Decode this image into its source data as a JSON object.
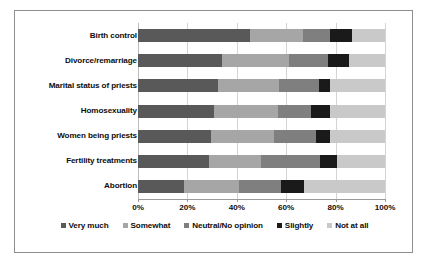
{
  "chart_data": {
    "type": "bar",
    "orientation": "horizontal",
    "stacked": true,
    "stacked_mode": "percent",
    "title": "",
    "subtitle": "",
    "xlabel": "",
    "ylabel": "",
    "xlim": [
      0,
      100
    ],
    "xticks": [
      0,
      20,
      40,
      60,
      80,
      100
    ],
    "xtick_labels": [
      "0%",
      "20%",
      "40%",
      "60%",
      "80%",
      "100%"
    ],
    "grid": true,
    "grid_axis": "x",
    "legend_position": "bottom",
    "categories": [
      "Birth control",
      "Divorce/remarriage",
      "Marital status of priests",
      "Homosexuality",
      "Women being priests",
      "Fertility treatments",
      "Abortion"
    ],
    "series": [
      {
        "name": "Very much",
        "color": "#595959",
        "values": [
          45.4,
          34.1,
          32.5,
          30.6,
          29.7,
          28.9,
          18.8
        ]
      },
      {
        "name": "Somewhat",
        "color": "#a6a6a6",
        "values": [
          21.4,
          27.2,
          24.5,
          25.9,
          25.4,
          20.8,
          22.2
        ]
      },
      {
        "name": "Neutral/No opinion",
        "color": "#7f7f7f",
        "values": [
          10.9,
          15.7,
          16.2,
          13.5,
          16.8,
          24.0,
          16.8
        ]
      },
      {
        "name": "Slightly",
        "color": "#1a1a1a",
        "values": [
          8.9,
          8.6,
          4.5,
          7.7,
          5.8,
          6.9,
          9.4
        ]
      },
      {
        "name": "Not at all",
        "color": "#c9c9c9",
        "values": [
          13.4,
          14.4,
          22.3,
          22.3,
          22.3,
          19.4,
          32.8
        ]
      }
    ]
  },
  "legend": {
    "items": [
      {
        "label": "Very much",
        "color": "#595959"
      },
      {
        "label": "Somewhat",
        "color": "#a6a6a6"
      },
      {
        "label": "Neutral/No opinion",
        "color": "#7f7f7f"
      },
      {
        "label": "Slightly",
        "color": "#1a1a1a"
      },
      {
        "label": "Not at all",
        "color": "#c9c9c9"
      }
    ]
  },
  "axis": {
    "tick_labels": [
      "0%",
      "20%",
      "40%",
      "60%",
      "80%",
      "100%"
    ]
  }
}
